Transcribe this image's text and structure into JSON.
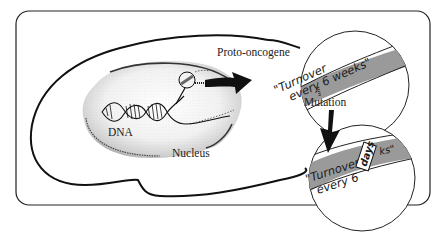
{
  "diagram": {
    "labels": {
      "proto_oncogene": "Proto-oncogene",
      "dna": "DNA",
      "nucleus": "Nucleus",
      "mutation": "Mutation"
    },
    "inset_top": {
      "text_line1": "\"Turnover",
      "text_line2": "every 6 weeks\""
    },
    "inset_bottom": {
      "text_line1": "\"Turnover",
      "text_line2": "every 6",
      "text_tail": "ks\"",
      "replacement_tag": "days"
    },
    "colors": {
      "ink": "#1a1a1a",
      "gene_band": "#9a9a9a",
      "background": "#ffffff",
      "tag_bg": "#ffffff"
    }
  }
}
